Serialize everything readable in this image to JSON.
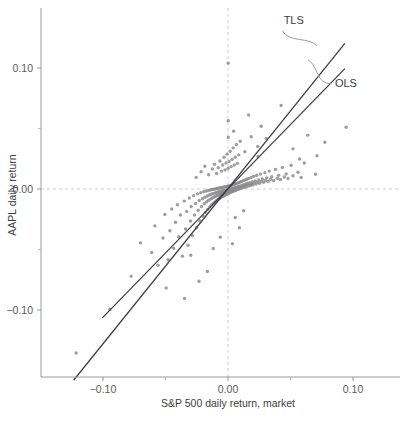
{
  "chart_data": {
    "type": "scatter",
    "title": "",
    "xlabel": "S&P 500 daily return, market",
    "ylabel": "AAPL daily return",
    "xlim": [
      -0.142,
      0.126
    ],
    "ylim": [
      -0.155,
      0.145
    ],
    "xticks": [
      -0.1,
      0.0,
      0.1
    ],
    "xtick_labels": [
      "−0.10",
      "0.00",
      "0.10"
    ],
    "yticks": [
      0.1,
      0.0,
      -0.1
    ],
    "ytick_labels": [
      "0.10",
      "0.00",
      "−0.10"
    ],
    "x_minor_ticks": [
      -0.05,
      0.05
    ],
    "y_minor_ticks": [
      0.05,
      -0.05
    ],
    "grid": false,
    "reference_lines": [
      {
        "name": "zero-vertical",
        "orientation": "vertical",
        "value": 0.0,
        "style": "dashed",
        "color": "#cfcfcf"
      },
      {
        "name": "zero-horizontal",
        "orientation": "horizontal",
        "value": 0.0,
        "style": "dashed",
        "color": "#cfcfcf"
      }
    ],
    "marker": {
      "shape": "circle",
      "size": 3.4,
      "color": "#8d8d8d",
      "opacity": 0.85
    },
    "legend_position": "inline-annotations",
    "annotations": [
      {
        "name": "tls-label",
        "label": "TLS",
        "x": 0.0445,
        "y": 0.1365
      },
      {
        "name": "ols-label",
        "label": "OLS",
        "x": 0.0855,
        "y": 0.0845
      }
    ],
    "series": [
      {
        "name": "AAPL vs S&P 500 daily returns",
        "n_points": 252,
        "points": [
          [
            -0.1215,
            -0.1355
          ],
          [
            -0.0945,
            -0.0995
          ],
          [
            -0.0775,
            -0.072
          ],
          [
            -0.07,
            -0.0445
          ],
          [
            -0.061,
            -0.0525
          ],
          [
            -0.0585,
            -0.0305
          ],
          [
            -0.056,
            -0.063
          ],
          [
            -0.052,
            -0.0405
          ],
          [
            -0.0505,
            -0.021
          ],
          [
            -0.048,
            -0.0585
          ],
          [
            -0.0465,
            -0.0345
          ],
          [
            -0.045,
            -0.0165
          ],
          [
            -0.0435,
            -0.049
          ],
          [
            -0.042,
            -0.0275
          ],
          [
            -0.0405,
            -0.013
          ],
          [
            -0.0395,
            -0.0395
          ],
          [
            -0.038,
            -0.0215
          ],
          [
            -0.0365,
            -0.0555
          ],
          [
            -0.035,
            -0.01
          ],
          [
            -0.034,
            -0.033
          ],
          [
            -0.033,
            -0.0185
          ],
          [
            -0.032,
            -0.0465
          ],
          [
            -0.031,
            -0.0075
          ],
          [
            -0.03,
            -0.0265
          ],
          [
            -0.0295,
            -0.0145
          ],
          [
            -0.0285,
            -0.0385
          ],
          [
            -0.0275,
            -0.0055
          ],
          [
            -0.0268,
            -0.0215
          ],
          [
            -0.026,
            -0.012
          ],
          [
            -0.0252,
            -0.032
          ],
          [
            -0.0245,
            -0.004
          ],
          [
            -0.0238,
            -0.0175
          ],
          [
            -0.023,
            -0.0095
          ],
          [
            -0.0225,
            -0.0265
          ],
          [
            -0.0218,
            -0.003
          ],
          [
            -0.0212,
            -0.0145
          ],
          [
            -0.0205,
            -0.008
          ],
          [
            -0.02,
            -0.0225
          ],
          [
            -0.0195,
            -0.0022
          ],
          [
            -0.019,
            -0.0122
          ],
          [
            -0.0185,
            -0.0068
          ],
          [
            -0.018,
            -0.0192
          ],
          [
            -0.0175,
            -0.0016
          ],
          [
            -0.017,
            -0.0105
          ],
          [
            -0.0166,
            -0.0058
          ],
          [
            -0.0162,
            -0.0168
          ],
          [
            -0.0158,
            -0.0012
          ],
          [
            -0.0154,
            -0.0092
          ],
          [
            -0.015,
            -0.005
          ],
          [
            -0.0146,
            -0.0148
          ],
          [
            -0.0142,
            -0.0008
          ],
          [
            -0.0138,
            -0.0082
          ],
          [
            -0.0135,
            -0.0044
          ],
          [
            -0.0132,
            -0.0132
          ],
          [
            -0.0128,
            -0.0004
          ],
          [
            -0.0125,
            -0.0074
          ],
          [
            -0.0122,
            -0.0038
          ],
          [
            -0.0118,
            -0.0118
          ],
          [
            -0.0115,
            -0.0002
          ],
          [
            -0.0112,
            -0.0066
          ],
          [
            -0.0108,
            -0.0034
          ],
          [
            -0.0105,
            -0.0106
          ],
          [
            -0.0102,
            0.0
          ],
          [
            -0.0099,
            -0.006
          ],
          [
            -0.0096,
            -0.003
          ],
          [
            -0.0093,
            -0.0096
          ],
          [
            -0.009,
            0.0004
          ],
          [
            -0.0087,
            -0.0054
          ],
          [
            -0.0085,
            -0.0026
          ],
          [
            -0.0082,
            -0.0088
          ],
          [
            -0.0079,
            0.0006
          ],
          [
            -0.0076,
            -0.0049
          ],
          [
            -0.0074,
            -0.0023
          ],
          [
            -0.0071,
            -0.008
          ],
          [
            -0.0068,
            0.0008
          ],
          [
            -0.0066,
            -0.0045
          ],
          [
            -0.0063,
            -0.002
          ],
          [
            -0.0061,
            -0.0073
          ],
          [
            -0.0058,
            0.001
          ],
          [
            -0.0056,
            -0.0041
          ],
          [
            -0.0053,
            -0.0018
          ],
          [
            -0.0051,
            -0.0067
          ],
          [
            -0.0048,
            0.0012
          ],
          [
            -0.0046,
            -0.0038
          ],
          [
            -0.0044,
            -0.0015
          ],
          [
            -0.0041,
            -0.0061
          ],
          [
            -0.0039,
            0.0014
          ],
          [
            -0.0037,
            -0.0034
          ],
          [
            -0.0035,
            -0.0013
          ],
          [
            -0.0032,
            -0.0056
          ],
          [
            -0.003,
            0.0016
          ],
          [
            -0.0028,
            -0.0031
          ],
          [
            -0.0026,
            -0.0011
          ],
          [
            -0.0024,
            -0.0051
          ],
          [
            -0.0022,
            0.0018
          ],
          [
            -0.002,
            -0.0028
          ],
          [
            -0.0018,
            -0.0009
          ],
          [
            -0.0016,
            -0.0046
          ],
          [
            -0.0014,
            0.002
          ],
          [
            -0.0012,
            -0.0025
          ],
          [
            -0.001,
            -0.0007
          ],
          [
            -0.0008,
            -0.0042
          ],
          [
            -0.0006,
            0.0022
          ],
          [
            -0.0004,
            -0.0022
          ],
          [
            -0.0002,
            -0.0005
          ],
          [
            0.0,
            -0.0038
          ],
          [
            0.0002,
            0.0024
          ],
          [
            0.0004,
            -0.0019
          ],
          [
            0.0006,
            -0.0003
          ],
          [
            0.0008,
            -0.0034
          ],
          [
            0.001,
            0.0026
          ],
          [
            0.0012,
            -0.0016
          ],
          [
            0.0014,
            -0.0001
          ],
          [
            0.0016,
            -0.003
          ],
          [
            0.0018,
            0.0028
          ],
          [
            0.002,
            -0.0013
          ],
          [
            0.0022,
            0.0001
          ],
          [
            0.0024,
            -0.0026
          ],
          [
            0.0026,
            0.003
          ],
          [
            0.0028,
            -0.001
          ],
          [
            0.003,
            0.0003
          ],
          [
            0.0032,
            -0.0022
          ],
          [
            0.0034,
            0.0033
          ],
          [
            0.0037,
            -0.0007
          ],
          [
            0.0039,
            0.0005
          ],
          [
            0.0041,
            -0.0018
          ],
          [
            0.0044,
            0.0036
          ],
          [
            0.0046,
            -0.0004
          ],
          [
            0.0048,
            0.0008
          ],
          [
            0.0051,
            -0.0014
          ],
          [
            0.0053,
            0.004
          ],
          [
            0.0056,
            -0.0001
          ],
          [
            0.0058,
            0.0011
          ],
          [
            0.0061,
            -0.001
          ],
          [
            0.0063,
            0.0044
          ],
          [
            0.0066,
            0.0002
          ],
          [
            0.0068,
            0.0014
          ],
          [
            0.0071,
            -0.0006
          ],
          [
            0.0074,
            0.0048
          ],
          [
            0.0076,
            0.0005
          ],
          [
            0.0079,
            0.0018
          ],
          [
            0.0082,
            -0.0002
          ],
          [
            0.0085,
            0.0052
          ],
          [
            0.0087,
            0.0009
          ],
          [
            0.009,
            0.0022
          ],
          [
            0.0093,
            0.0002
          ],
          [
            0.0096,
            0.0057
          ],
          [
            0.0099,
            0.0013
          ],
          [
            0.0102,
            0.0026
          ],
          [
            0.0105,
            0.0006
          ],
          [
            0.0108,
            0.0062
          ],
          [
            0.0112,
            0.0017
          ],
          [
            0.0115,
            0.0031
          ],
          [
            0.0118,
            0.001
          ],
          [
            0.0122,
            0.0068
          ],
          [
            0.0125,
            0.0022
          ],
          [
            0.0128,
            0.0036
          ],
          [
            0.0132,
            0.0014
          ],
          [
            0.0135,
            0.0074
          ],
          [
            0.0138,
            0.0027
          ],
          [
            0.0142,
            0.0041
          ],
          [
            0.0146,
            0.0019
          ],
          [
            0.015,
            0.0081
          ],
          [
            0.0154,
            0.0032
          ],
          [
            0.0158,
            0.0047
          ],
          [
            0.0162,
            0.0024
          ],
          [
            0.0166,
            0.0088
          ],
          [
            0.017,
            0.0038
          ],
          [
            0.0175,
            0.0053
          ],
          [
            0.018,
            0.0029
          ],
          [
            0.0185,
            0.0096
          ],
          [
            0.019,
            0.0044
          ],
          [
            0.0195,
            0.006
          ],
          [
            0.02,
            0.0035
          ],
          [
            0.0205,
            0.0105
          ],
          [
            0.0212,
            0.005
          ],
          [
            0.0218,
            0.0067
          ],
          [
            0.0225,
            0.0041
          ],
          [
            0.023,
            0.0114
          ],
          [
            0.0238,
            0.0057
          ],
          [
            0.0245,
            0.0075
          ],
          [
            0.0252,
            0.0048
          ],
          [
            0.026,
            0.0124
          ],
          [
            0.0268,
            0.0064
          ],
          [
            0.0275,
            0.0083
          ],
          [
            0.0285,
            0.0055
          ],
          [
            0.0295,
            0.0135
          ],
          [
            0.03,
            0.0072
          ],
          [
            0.031,
            0.0092
          ],
          [
            0.032,
            0.0062
          ],
          [
            0.033,
            0.0148
          ],
          [
            0.034,
            0.008
          ],
          [
            0.035,
            0.0102
          ],
          [
            0.0365,
            0.007
          ],
          [
            0.038,
            0.0162
          ],
          [
            0.0395,
            0.0089
          ],
          [
            0.0405,
            0.0113
          ],
          [
            0.042,
            0.0078
          ],
          [
            0.0435,
            0.0178
          ],
          [
            0.045,
            0.0099
          ],
          [
            0.0465,
            0.0125
          ],
          [
            0.048,
            0.0087
          ],
          [
            0.0505,
            0.0196
          ],
          [
            0.052,
            0.011
          ],
          [
            0.056,
            0.0138
          ],
          [
            0.0585,
            0.0096
          ],
          [
            0.061,
            0.0215
          ],
          [
            0.07,
            0.0122
          ],
          [
            0.0775,
            0.0386
          ],
          [
            0.0945,
            0.051
          ],
          [
            -0.0255,
            0.0096
          ],
          [
            -0.0215,
            0.0142
          ],
          [
            -0.0185,
            0.0188
          ],
          [
            -0.0155,
            0.0118
          ],
          [
            -0.0125,
            0.0165
          ],
          [
            -0.0108,
            0.0205
          ],
          [
            -0.0092,
            0.0128
          ],
          [
            -0.0078,
            0.0175
          ],
          [
            -0.0065,
            0.0232
          ],
          [
            -0.0052,
            0.0148
          ],
          [
            -0.0042,
            0.0198
          ],
          [
            -0.0032,
            0.0262
          ],
          [
            -0.0024,
            0.0158
          ],
          [
            -0.0016,
            0.0215
          ],
          [
            -0.0008,
            0.0288
          ],
          [
            0.0001,
            0.0172
          ],
          [
            0.0009,
            0.0228
          ],
          [
            0.0017,
            0.0312
          ],
          [
            0.0025,
            0.0185
          ],
          [
            0.0033,
            0.0245
          ],
          [
            0.0042,
            0.034
          ],
          [
            0.005,
            0.0198
          ],
          [
            0.0058,
            0.0262
          ],
          [
            0.0067,
            0.0368
          ],
          [
            0.0076,
            0.0212
          ],
          [
            0.0086,
            0.0282
          ],
          [
            0.0002,
            0.0425
          ],
          [
            0.0045,
            0.0478
          ],
          [
            0.0098,
            0.0395
          ],
          [
            0.0135,
            0.0308
          ],
          [
            0.0185,
            0.0432
          ],
          [
            0.0238,
            0.0352
          ],
          [
            0.0265,
            0.0518
          ],
          [
            0.0305,
            0.0418
          ],
          [
            0.0002,
            0.104
          ],
          [
            0.0002,
            0.0565
          ],
          [
            0.0165,
            0.0612
          ],
          [
            0.024,
            0.0268
          ],
          [
            0.0425,
            0.069
          ],
          [
            0.052,
            0.0332
          ],
          [
            0.0572,
            0.0248
          ],
          [
            0.0638,
            0.0445
          ],
          [
            0.0712,
            0.0275
          ],
          [
            0.0058,
            -0.0235
          ],
          [
            0.0125,
            -0.018
          ],
          [
            0.0092,
            -0.032
          ],
          [
            -0.0495,
            -0.0818
          ],
          [
            -0.0348,
            -0.0905
          ],
          [
            -0.0232,
            -0.0762
          ],
          [
            -0.0165,
            -0.0682
          ],
          [
            -0.0298,
            -0.0548
          ],
          [
            -0.0118,
            -0.0492
          ],
          [
            -0.0062,
            -0.0398
          ],
          [
            0.0035,
            -0.0452
          ]
        ]
      }
    ],
    "fit_lines": [
      {
        "name": "TLS",
        "label": "TLS",
        "type": "total-least-squares",
        "slope": 1.283,
        "intercept": 0.0004,
        "color": "#3f3f4a",
        "x_start": -0.1235,
        "x_end": 0.0935
      },
      {
        "name": "OLS",
        "label": "OLS",
        "type": "ordinary-least-squares",
        "slope": 1.062,
        "intercept": 0.0002,
        "color": "#3f3f4a",
        "x_start": -0.1005,
        "x_end": 0.0935
      }
    ]
  },
  "caption": ""
}
